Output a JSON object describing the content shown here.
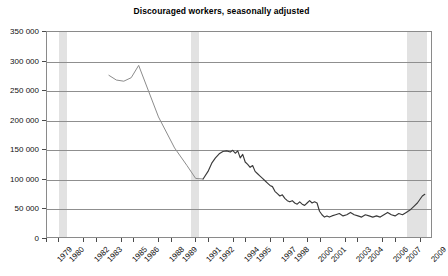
{
  "chart_data": {
    "type": "line",
    "title": "Discouraged workers, seasonally adjusted",
    "xlabel": "",
    "ylabel": "",
    "ylim": [
      0,
      350000
    ],
    "yticks": [
      0,
      50000,
      100000,
      150000,
      200000,
      250000,
      300000,
      350000
    ],
    "ytick_labels": [
      "0",
      "50 000",
      "100 000",
      "150 000",
      "200 000",
      "250 000",
      "300 000",
      "350 000"
    ],
    "xlim": [
      1979,
      2010
    ],
    "xtick_labels": [
      "1979",
      "1980",
      "1982",
      "1983",
      "1985",
      "1986",
      "1988",
      "1989",
      "1991",
      "1992",
      "1994",
      "1995",
      "1997",
      "1998",
      "2000",
      "2001",
      "2003",
      "2004",
      "2006",
      "2007",
      "2009"
    ],
    "xtick_values": [
      1979,
      1980,
      1982,
      1983,
      1985,
      1986,
      1988,
      1989,
      1991,
      1992,
      1994,
      1995,
      1997,
      1998,
      2000,
      2001,
      2003,
      2004,
      2006,
      2007,
      2009
    ],
    "grid": "horizontal",
    "legend": "none",
    "line_color": "#3a3a3a",
    "early_line_color": "#8c8c8c",
    "band_color": "#e2e2e2",
    "frame_color": "#8a8a8a",
    "shaded_bands": [
      {
        "label": "recession-band-1",
        "start": 1980.0,
        "end": 1980.6
      },
      {
        "label": "recession-band-2",
        "start": 1990.6,
        "end": 1991.2
      },
      {
        "label": "recession-band-3",
        "start": 2007.9,
        "end": 2009.5
      }
    ],
    "series": [
      {
        "name": "Discouraged workers (early, annual)",
        "x": [
          1984.0,
          1984.6,
          1985.2,
          1985.8,
          1986.4,
          1988.0,
          1989.3,
          1990.3,
          1991.0,
          1991.6
        ],
        "values": [
          276000,
          268000,
          266000,
          272000,
          293000,
          205000,
          152000,
          122000,
          100000,
          99000
        ]
      },
      {
        "name": "Discouraged workers (monthly)",
        "x": [
          1991.6,
          1992.0,
          1992.3,
          1992.6,
          1992.9,
          1993.2,
          1993.5,
          1993.8,
          1994.0,
          1994.2,
          1994.4,
          1994.6,
          1994.8,
          1995.0,
          1995.2,
          1995.4,
          1995.6,
          1995.8,
          1996.0,
          1996.2,
          1996.4,
          1996.6,
          1996.8,
          1997.0,
          1997.2,
          1997.4,
          1997.6,
          1997.8,
          1998.0,
          1998.2,
          1998.4,
          1998.6,
          1998.8,
          1999.0,
          1999.2,
          1999.4,
          1999.6,
          1999.8,
          2000.0,
          2000.2,
          2000.4,
          2000.6,
          2000.8,
          2001.0,
          2001.2,
          2001.4,
          2001.6,
          2001.8,
          2002.0,
          2002.3,
          2002.6,
          2002.9,
          2003.2,
          2003.5,
          2003.8,
          2004.1,
          2004.4,
          2004.7,
          2005.0,
          2005.3,
          2005.6,
          2005.9,
          2006.2,
          2006.5,
          2006.8,
          2007.1,
          2007.4,
          2007.7,
          2008.0,
          2008.3,
          2008.6,
          2008.9,
          2009.1,
          2009.3,
          2009.5
        ],
        "values": [
          99000,
          112000,
          126000,
          135000,
          142000,
          146000,
          147000,
          145000,
          148000,
          143000,
          147000,
          135000,
          141000,
          128000,
          124000,
          119000,
          122000,
          112000,
          108000,
          104000,
          100000,
          96000,
          92000,
          88000,
          86000,
          78000,
          74000,
          70000,
          72000,
          66000,
          62000,
          60000,
          62000,
          58000,
          56000,
          60000,
          56000,
          54000,
          58000,
          62000,
          58000,
          60000,
          58000,
          44000,
          38000,
          34000,
          36000,
          34000,
          36000,
          38000,
          40000,
          36000,
          38000,
          42000,
          38000,
          36000,
          34000,
          38000,
          36000,
          34000,
          36000,
          34000,
          38000,
          42000,
          38000,
          36000,
          40000,
          38000,
          42000,
          46000,
          52000,
          58000,
          64000,
          70000,
          73000
        ]
      }
    ]
  }
}
